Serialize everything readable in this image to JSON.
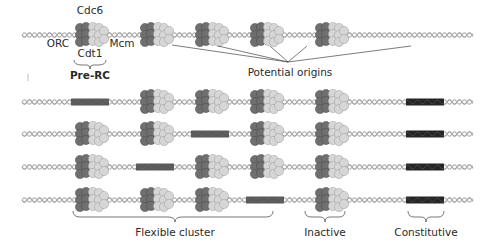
{
  "figure": {
    "labels": {
      "cdc6": "Cdc6",
      "orc": "ORC",
      "mcm": "Mcm",
      "cdt1": "Cdt1",
      "pre_rc": "Pre-RC",
      "potential_origins": "Potential origins",
      "flexible_cluster": "Flexible cluster",
      "inactive": "Inactive",
      "constitutive": "Constitutive"
    },
    "colors": {
      "dna": "#9a9a9a",
      "orc_dark": "#6f6f6f",
      "mcm_light": "#d6d6d6",
      "fired_origin": "#5a5a5a",
      "constitutive_origin": "#262626"
    },
    "slots": [
      "origin-1",
      "origin-2",
      "origin-3",
      "origin-4",
      "origin-5",
      "constitutive-origin"
    ],
    "rows": [
      {
        "name": "licensed-state",
        "states": [
          "complex",
          "complex",
          "complex",
          "complex",
          "complex",
          "none"
        ]
      },
      {
        "name": "cell-1",
        "states": [
          "fired",
          "complex",
          "complex",
          "complex",
          "complex",
          "constitutive"
        ]
      },
      {
        "name": "cell-2",
        "states": [
          "complex",
          "complex",
          "fired",
          "complex",
          "complex",
          "constitutive"
        ]
      },
      {
        "name": "cell-3",
        "states": [
          "complex",
          "fired",
          "complex",
          "complex",
          "complex",
          "constitutive"
        ]
      },
      {
        "name": "cell-4",
        "states": [
          "complex",
          "complex",
          "complex",
          "fired",
          "complex",
          "constitutive"
        ]
      }
    ]
  }
}
